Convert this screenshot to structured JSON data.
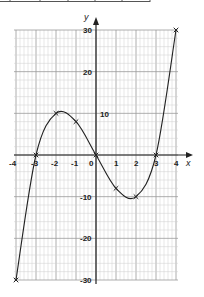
{
  "chart_data": {
    "type": "line",
    "title": "",
    "xlabel": "x",
    "ylabel": "y",
    "xlim": [
      -4,
      4
    ],
    "ylim": [
      -30,
      30
    ],
    "grid": true,
    "x_ticks": [
      "-4",
      "-3",
      "-2",
      "-1",
      "0",
      "1",
      "2",
      "3",
      "4"
    ],
    "y_ticks": [
      "30",
      "20",
      "10",
      "-10",
      "-20",
      "-30"
    ],
    "series": [
      {
        "name": "curve",
        "x": [
          -4,
          -3,
          -2,
          -1,
          0,
          1,
          2,
          3,
          4
        ],
        "y": [
          -30,
          0,
          10,
          8,
          0,
          -8,
          -10,
          0,
          30
        ],
        "markers": "x"
      }
    ],
    "values_note": "approximate readings from the plotted points"
  },
  "labels": {
    "x_axis": "x",
    "y_axis": "y",
    "origin": "0",
    "xt_m4": "-4",
    "xt_m3": "-3",
    "xt_m2": "-2",
    "xt_m1": "-1",
    "xt_1": "1",
    "xt_2": "2",
    "xt_3": "3",
    "xt_4": "4",
    "yt_30": "30",
    "yt_20": "20",
    "yt_10": "10",
    "yt_m10": "-10",
    "yt_m20": "-20",
    "yt_m30": "-30"
  }
}
